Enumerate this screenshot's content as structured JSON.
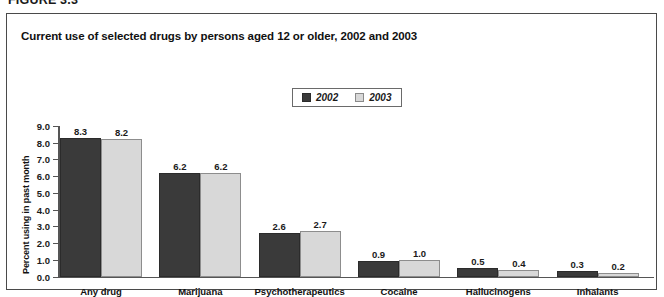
{
  "figure": {
    "label": "FIGURE 3.3"
  },
  "chart_title": "Current use of selected drugs by persons aged 12 or older, 2002 and 2003",
  "legend": {
    "entries": [
      {
        "label": "2002",
        "swatch": "dark-swatch-icon",
        "color": "#3a3a3a"
      },
      {
        "label": "2003",
        "swatch": "light-swatch-icon",
        "color": "#d8d8d8"
      }
    ]
  },
  "axes": {
    "ylabel": "Percent using in past month",
    "yticks": [
      "0.0",
      "1.0",
      "2.0",
      "3.0",
      "4.0",
      "5.0",
      "6.0",
      "7.0",
      "8.0",
      "9.0"
    ],
    "ylim": [
      0,
      9
    ],
    "xlabel": ""
  },
  "chart_data": {
    "type": "bar",
    "title": "Current use of selected drugs by persons aged 12 or older, 2002 and 2003",
    "xlabel": "",
    "ylabel": "Percent using in past month",
    "ylim": [
      0,
      9
    ],
    "ytick_step": 1.0,
    "grid": false,
    "legend_position": "top-center",
    "categories": [
      "Any drug",
      "Marijuana",
      "Psychotherapeutics",
      "Cocaine",
      "Hallucinogens",
      "Inhalants"
    ],
    "series": [
      {
        "name": "2002",
        "color": "#3a3a3a",
        "values": [
          8.3,
          6.2,
          2.6,
          0.9,
          0.5,
          0.3
        ]
      },
      {
        "name": "2003",
        "color": "#d8d8d8",
        "values": [
          8.2,
          6.2,
          2.7,
          1.0,
          0.4,
          0.2
        ]
      }
    ],
    "value_labels": [
      [
        "8.3",
        "8.2"
      ],
      [
        "6.2",
        "6.2"
      ],
      [
        "2.6",
        "2.7"
      ],
      [
        "0.9",
        "1.0"
      ],
      [
        "0.5",
        "0.4"
      ],
      [
        "0.3",
        "0.2"
      ]
    ]
  }
}
